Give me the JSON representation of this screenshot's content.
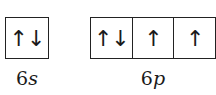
{
  "subshells": [
    {
      "number": "6",
      "letter": "s",
      "orbitals": [
        "↑↓"
      ]
    },
    {
      "number": "6",
      "letter": "p",
      "orbitals": [
        "↑↓",
        "↑",
        "↑"
      ]
    }
  ]
}
